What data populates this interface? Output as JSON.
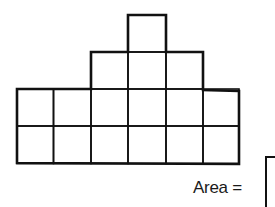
{
  "figure": {
    "rows": [
      {
        "row": 1,
        "start_col": 3,
        "count": 1
      },
      {
        "row": 2,
        "start_col": 2,
        "count": 3
      },
      {
        "row": 3,
        "start_col": 0,
        "count": 6
      },
      {
        "row": 4,
        "start_col": 0,
        "count": 6
      }
    ],
    "total_squares": 16,
    "line_color": "#111111"
  },
  "answer": {
    "label": "Area =",
    "value": ""
  }
}
